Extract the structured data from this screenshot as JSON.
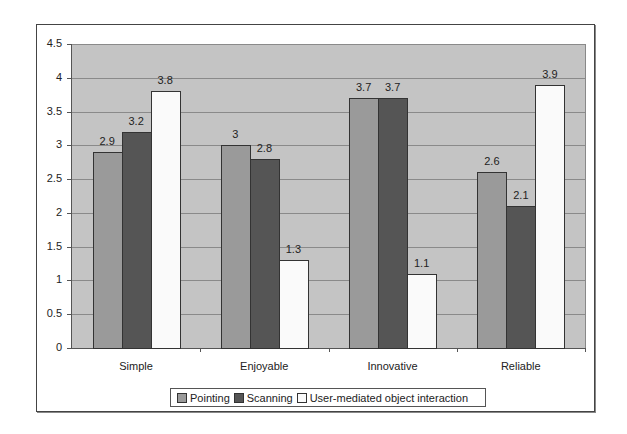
{
  "chart_data": {
    "type": "bar",
    "title": "",
    "xlabel": "",
    "ylabel": "",
    "categories": [
      "Simple",
      "Enjoyable",
      "Innovative",
      "Reliable"
    ],
    "series": [
      {
        "name": "Pointing",
        "color": "#9a9a9a",
        "values": [
          2.9,
          3,
          3.7,
          2.6
        ]
      },
      {
        "name": "Scanning",
        "color": "#555555",
        "values": [
          3.2,
          2.8,
          3.7,
          2.1
        ]
      },
      {
        "name": "User-mediated object interaction",
        "color": "#fafafa",
        "values": [
          3.8,
          1.3,
          1.1,
          3.9
        ]
      }
    ],
    "data_labels": [
      [
        "2.9",
        "3.2",
        "3.8"
      ],
      [
        "3",
        "2.8",
        "1.3"
      ],
      [
        "3.7",
        "3.7",
        "1.1"
      ],
      [
        "2.6",
        "2.1",
        "3.9"
      ]
    ],
    "ylim": [
      0,
      4.5
    ],
    "yticks": [
      "0",
      "0.5",
      "1",
      "1.5",
      "2",
      "2.5",
      "3",
      "3.5",
      "4",
      "4.5"
    ],
    "grid": true,
    "plot_background": "#c4c4c4",
    "legend_position": "bottom"
  }
}
